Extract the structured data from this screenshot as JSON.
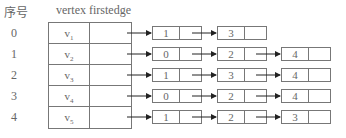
{
  "headers": {
    "index": "序号",
    "columns": "vertex firstedge"
  },
  "vertices": [
    {
      "index": "0",
      "name": "v",
      "sub": "1",
      "edges": [
        "1",
        "3"
      ]
    },
    {
      "index": "1",
      "name": "v",
      "sub": "2",
      "edges": [
        "0",
        "2",
        "4"
      ]
    },
    {
      "index": "2",
      "name": "v",
      "sub": "3",
      "edges": [
        "1",
        "3",
        "4"
      ]
    },
    {
      "index": "3",
      "name": "v",
      "sub": "4",
      "edges": [
        "0",
        "2",
        "4"
      ]
    },
    {
      "index": "4",
      "name": "v",
      "sub": "5",
      "edges": [
        "1",
        "2",
        "3"
      ]
    }
  ]
}
